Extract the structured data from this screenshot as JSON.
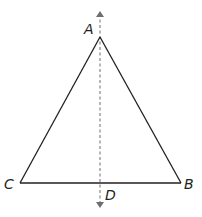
{
  "diagram": {
    "type": "isosceles-triangle-with-axis-of-symmetry",
    "colors": {
      "stroke": "#231f20",
      "dashed": "#6d6e71",
      "background": "#ffffff"
    },
    "points": {
      "A": {
        "label": "A",
        "x": 100,
        "y": 37
      },
      "B": {
        "label": "B",
        "x": 181,
        "y": 183
      },
      "C": {
        "label": "C",
        "x": 20,
        "y": 183
      },
      "D": {
        "label": "D",
        "x": 100,
        "y": 183
      }
    },
    "segments": [
      {
        "from": "A",
        "to": "B"
      },
      {
        "from": "A",
        "to": "C"
      },
      {
        "from": "C",
        "to": "B"
      }
    ],
    "axis": {
      "style": "dashed",
      "x": 100,
      "y_top": 12,
      "y_bottom": 207,
      "arrows": "both"
    }
  }
}
